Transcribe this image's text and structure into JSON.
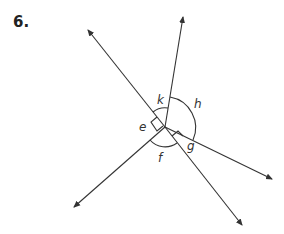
{
  "problem_number": "6.",
  "diagram": {
    "vertex": {
      "x": 165,
      "y": 127
    },
    "rays": [
      {
        "name": "upper-left",
        "tip": {
          "x": 87,
          "y": 29
        }
      },
      {
        "name": "top",
        "tip": {
          "x": 183,
          "y": 16
        }
      },
      {
        "name": "right",
        "tip": {
          "x": 273,
          "y": 180
        }
      },
      {
        "name": "lower-right",
        "tip": {
          "x": 243,
          "y": 226
        }
      },
      {
        "name": "lower-left",
        "tip": {
          "x": 73,
          "y": 208
        }
      }
    ],
    "angle_labels": {
      "k": "k",
      "h": "h",
      "e": "e",
      "f": "f",
      "g": "g"
    },
    "right_angle_marks": [
      "e",
      "g"
    ],
    "line_color": "#333333"
  }
}
